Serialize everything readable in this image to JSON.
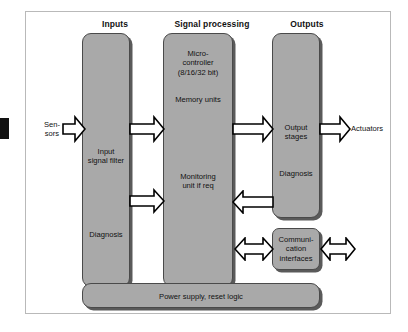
{
  "diagram": {
    "colors": {
      "block_fill": "#a9a9a9",
      "block_border": "#4a4a4a",
      "block_shadow": "#5a5a5a",
      "frame_border": "#b9b9b9",
      "background": "#ffffff",
      "arrow_fill": "#ffffff",
      "arrow_stroke": "#000000",
      "tab": "#111111"
    },
    "headings": [
      {
        "id": "inputs",
        "label": "Inputs"
      },
      {
        "id": "signal-processing",
        "label": "Signal processing"
      },
      {
        "id": "outputs",
        "label": "Outputs"
      }
    ],
    "external_labels": {
      "sensors": "Sen-\nsors",
      "actuators": "Actuators"
    },
    "blocks": {
      "inputs_column": {
        "labels": {
          "input_signal_filter": "Input\nsignal filter",
          "diagnosis": "Diagnosis"
        }
      },
      "signal_processing_column": {
        "labels": {
          "microcontroller": "Micro-\ncontroller\n(8/16/32 bit)",
          "memory_units": "Memory units",
          "monitoring_unit": "Monitoring\nunit if req"
        }
      },
      "outputs_column": {
        "labels": {
          "output_stages": "Output stages",
          "diagnosis": "Diagnosis"
        }
      },
      "communication_interfaces": {
        "label": "Communi-\ncation\ninterfaces"
      },
      "power_supply": {
        "label": "Power supply, reset logic"
      }
    },
    "arrows": [
      {
        "id": "sensors-to-inputs",
        "direction": "right"
      },
      {
        "id": "inputs-filter-to-signal-processing",
        "direction": "right"
      },
      {
        "id": "inputs-diagnosis-to-signal-processing",
        "direction": "right"
      },
      {
        "id": "signal-processing-to-outputs",
        "direction": "right"
      },
      {
        "id": "outputs-to-actuators",
        "direction": "right"
      },
      {
        "id": "outputs-diagnosis-to-monitoring",
        "direction": "left"
      },
      {
        "id": "signal-processing-to-communication",
        "direction": "both"
      },
      {
        "id": "communication-to-external",
        "direction": "both"
      }
    ]
  }
}
